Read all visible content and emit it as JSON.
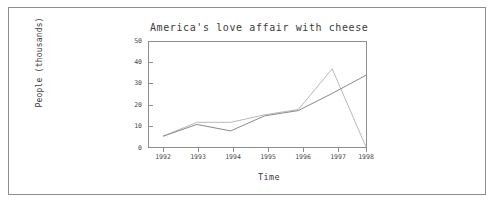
{
  "chart_data": {
    "type": "line",
    "title": "America's love affair with cheese",
    "xlabel": "Time",
    "ylabel": "People (thousands)",
    "x": [
      1992,
      1993,
      1994,
      1995,
      1996,
      1997,
      1998
    ],
    "xtick_labels": [
      "1992",
      "1993",
      "1994",
      "1995",
      "1996",
      "1997",
      "1998"
    ],
    "ytick_labels": [
      "0",
      "10",
      "20",
      "30",
      "40",
      "50"
    ],
    "yticks": [
      0,
      10,
      20,
      30,
      40,
      50
    ],
    "xlim": [
      1992,
      1998
    ],
    "ylim": [
      0,
      50
    ],
    "grid": false,
    "legend": "none",
    "series": [
      {
        "name": "series-1",
        "color": "#b9b9b9",
        "values": [
          5.5,
          12.0,
          12.0,
          15.5,
          18.0,
          37.0,
          0.5
        ]
      },
      {
        "name": "series-2",
        "color": "#8a8a8a",
        "values": [
          5.5,
          11.0,
          8.0,
          15.0,
          17.5,
          25.5,
          34.0
        ]
      }
    ]
  }
}
